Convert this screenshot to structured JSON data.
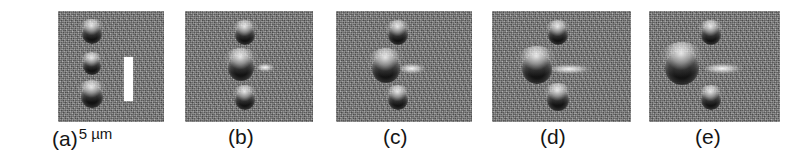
{
  "figure": {
    "type": "micrograph-panel-series",
    "background_color": "#ffffff",
    "panel_background_color": "#808080",
    "particle_color": "#111111",
    "scalebar_color": "#ffffff",
    "caption_color": "#151515",
    "panel_count": 5
  },
  "scalebar": {
    "value": "5",
    "unit": "µm",
    "label": "5 µm",
    "orientation": "vertical"
  },
  "panels": [
    {
      "id": "a",
      "label": "(a)",
      "x": 58,
      "width": 106,
      "has_scalebar": true,
      "scalebar": {
        "x": 66,
        "y": 46,
        "width": 9,
        "height": 44
      },
      "particles": [
        {
          "name": "top-particle",
          "cx": 34,
          "cy": 23,
          "r": 10,
          "streak": null
        },
        {
          "name": "middle-particle",
          "cx": 34,
          "cy": 55,
          "r": 9,
          "streak": null
        },
        {
          "name": "bottom-particle",
          "cx": 34,
          "cy": 86,
          "r": 11,
          "streak": null
        }
      ]
    },
    {
      "id": "b",
      "label": "(b)",
      "x": 185,
      "width": 128,
      "has_scalebar": false,
      "scalebar": null,
      "particles": [
        {
          "name": "top-particle",
          "cx": 60,
          "cy": 24,
          "r": 10,
          "streak": null
        },
        {
          "name": "middle-particle",
          "cx": 56,
          "cy": 57,
          "r": 13,
          "streak": {
            "x": 72,
            "y": 52,
            "w": 18,
            "h": 9
          }
        },
        {
          "name": "bottom-particle",
          "cx": 60,
          "cy": 89,
          "r": 10,
          "streak": null
        }
      ]
    },
    {
      "id": "c",
      "label": "(c)",
      "x": 336,
      "width": 136,
      "has_scalebar": false,
      "scalebar": null,
      "particles": [
        {
          "name": "top-particle",
          "cx": 62,
          "cy": 24,
          "r": 10,
          "streak": null
        },
        {
          "name": "middle-particle",
          "cx": 50,
          "cy": 58,
          "r": 14,
          "streak": {
            "x": 64,
            "y": 52,
            "w": 26,
            "h": 11
          }
        },
        {
          "name": "bottom-particle",
          "cx": 62,
          "cy": 89,
          "r": 10,
          "streak": null
        }
      ]
    },
    {
      "id": "d",
      "label": "(d)",
      "x": 492,
      "width": 139,
      "has_scalebar": false,
      "scalebar": null,
      "particles": [
        {
          "name": "top-particle",
          "cx": 66,
          "cy": 24,
          "r": 10,
          "streak": null
        },
        {
          "name": "middle-particle",
          "cx": 45,
          "cy": 58,
          "r": 15,
          "streak": {
            "x": 58,
            "y": 53,
            "w": 42,
            "h": 10
          }
        },
        {
          "name": "bottom-particle",
          "cx": 66,
          "cy": 89,
          "r": 11,
          "streak": null
        }
      ]
    },
    {
      "id": "e",
      "label": "(e)",
      "x": 649,
      "width": 131,
      "has_scalebar": false,
      "scalebar": null,
      "particles": [
        {
          "name": "top-particle",
          "cx": 62,
          "cy": 24,
          "r": 10,
          "streak": null
        },
        {
          "name": "middle-particle",
          "cx": 33,
          "cy": 57,
          "r": 17,
          "streak": {
            "x": 56,
            "y": 52,
            "w": 38,
            "h": 11
          }
        },
        {
          "name": "bottom-particle",
          "cx": 62,
          "cy": 89,
          "r": 10,
          "streak": null
        }
      ]
    }
  ],
  "captions": [
    {
      "id": "a",
      "label": "(a)",
      "x": 52,
      "unit_label": "5 µm"
    },
    {
      "id": "b",
      "label": "(b)",
      "x": 228,
      "unit_label": ""
    },
    {
      "id": "c",
      "label": "(c)",
      "x": 383,
      "unit_label": ""
    },
    {
      "id": "d",
      "label": "(d)",
      "x": 540,
      "unit_label": ""
    },
    {
      "id": "e",
      "label": "(e)",
      "x": 695,
      "unit_label": ""
    }
  ]
}
